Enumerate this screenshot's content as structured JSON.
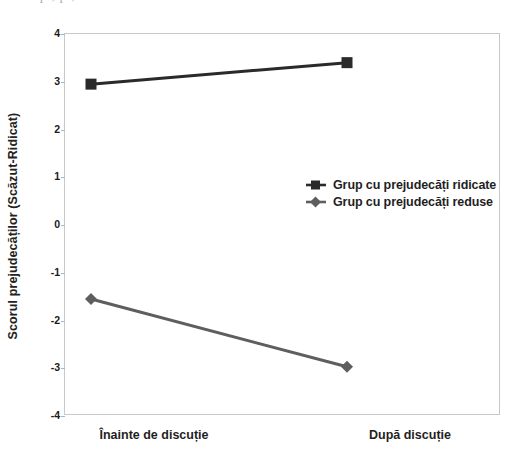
{
  "page": {
    "clipped_text_above": "o p , p  ,"
  },
  "chart_data": {
    "type": "line",
    "title": "",
    "subtitle": "",
    "xlabel": "",
    "ylabel": "Scorul prejudecăților (Scăzut-Ridicat)",
    "categories": [
      "Înainte de discuție",
      "După discuție"
    ],
    "x_tick_labels": [
      "Înainte de discuție",
      "După discuție"
    ],
    "y_tick_labels": [
      "4",
      "3",
      "2",
      "1",
      "0",
      "-1",
      "-2",
      "-3",
      "-4"
    ],
    "y_tick_values": [
      4,
      3,
      2,
      1,
      0,
      -1,
      -2,
      -3,
      -4
    ],
    "ylim": [
      -4,
      4
    ],
    "grid": false,
    "legend_position": "center-right-inside",
    "series": [
      {
        "name": "Grup cu prejudecăți ridicate",
        "marker": "square",
        "color": "#2a2a2a",
        "values": [
          2.95,
          3.4
        ]
      },
      {
        "name": "Grup cu prejudecăți reduse",
        "marker": "diamond",
        "color": "#5e5e5e",
        "values": [
          -1.55,
          -2.97
        ]
      }
    ],
    "legend_entries": [
      "Grup cu prejudecăți ridicate",
      "Grup cu prejudecăți reduse"
    ]
  },
  "colors": {
    "series_high": "#2a2a2a",
    "series_low": "#5e5e5e",
    "frame": "#c9c9c9",
    "text": "#1f1f1f",
    "background": "#ffffff"
  }
}
